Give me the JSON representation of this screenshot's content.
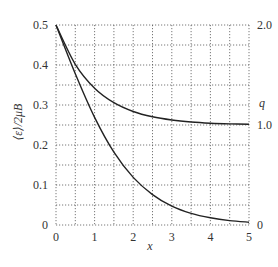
{
  "chart_data": {
    "type": "line",
    "title": "",
    "xlabel": "x",
    "ylabel": "⟨ε⟩/2μB",
    "y2label": "q",
    "xlim": [
      0,
      5
    ],
    "ylim": [
      0,
      0.5
    ],
    "y2lim": [
      0,
      2.0
    ],
    "grid": true,
    "x_ticks": [
      "0",
      "1",
      "2",
      "3",
      "4",
      "5"
    ],
    "y_ticks": [
      "0",
      "0.1",
      "0.2",
      "0.3",
      "0.4",
      "0.5"
    ],
    "y2_ticks": [
      "0",
      "1.0",
      "2.0"
    ],
    "series": [
      {
        "name": "⟨ε⟩/2μB",
        "axis": "left",
        "x": [
          0,
          0.5,
          1,
          1.5,
          2,
          2.5,
          3,
          3.5,
          4,
          4.5,
          5
        ],
        "values": [
          0.5,
          0.378,
          0.269,
          0.182,
          0.119,
          0.076,
          0.047,
          0.029,
          0.018,
          0.011,
          0.007
        ]
      },
      {
        "name": "q",
        "axis": "right",
        "x": [
          0,
          0.5,
          1,
          1.5,
          2,
          2.5,
          3,
          3.5,
          4,
          4.5,
          5
        ],
        "values": [
          2.0,
          1.607,
          1.368,
          1.223,
          1.135,
          1.082,
          1.05,
          1.03,
          1.018,
          1.011,
          1.007
        ]
      }
    ]
  },
  "axes": {
    "x_label": "x",
    "y_label_left": "⟨ε⟩/2μB",
    "y_label_right": "q"
  }
}
